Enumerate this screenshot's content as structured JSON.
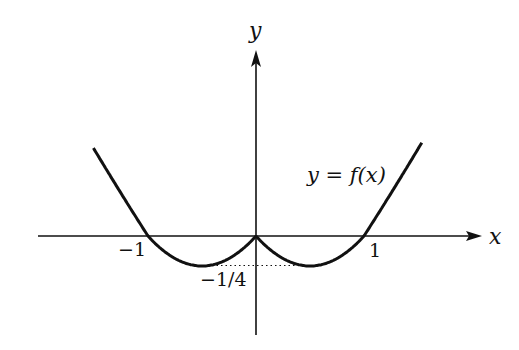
{
  "chart_data": {
    "type": "line",
    "title": "",
    "xlabel": "x",
    "ylabel": "y",
    "series": [
      {
        "name": "y = f(x)",
        "description": "W-shaped curve: f(x)=x^2-|x| style, zeros at x=-1,0,1, minima of -1/4 at x=-1/2 and x=1/2",
        "x": [
          -1.5,
          -1.25,
          -1.0,
          -0.75,
          -0.5,
          -0.25,
          0.0,
          0.25,
          0.5,
          0.75,
          1.0,
          1.25,
          1.5
        ],
        "values": [
          0.7,
          0.35,
          0.0,
          -0.19,
          -0.25,
          -0.19,
          0.0,
          -0.19,
          -0.25,
          -0.19,
          0.0,
          0.35,
          0.7
        ]
      }
    ],
    "annotations": [
      {
        "text": "y = f(x)",
        "target": "curve"
      },
      {
        "text": "−1/4",
        "target": "minimum value marker (dotted line)"
      }
    ],
    "x_ticks": [
      {
        "value": -1,
        "label": "−1"
      },
      {
        "value": 1,
        "label": "1"
      }
    ],
    "y_ticks": [
      {
        "value": -0.25,
        "label": "−1/4"
      }
    ],
    "grid": false,
    "legend": "none",
    "xlim": [
      -2.0,
      2.1
    ],
    "ylim": [
      -0.8,
      1.55
    ]
  },
  "labels": {
    "x_axis": "x",
    "y_axis": "y",
    "tick_neg1": "−1",
    "tick_pos1": "1",
    "tick_min": "−1/4",
    "function_label_y": "y",
    "function_label_eq": " = ",
    "function_label_f": "f",
    "function_label_arg": "(x)"
  },
  "colors": {
    "curve": "#111111",
    "axes": "#111111",
    "background": "#ffffff"
  }
}
